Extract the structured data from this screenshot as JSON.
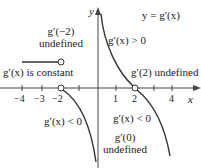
{
  "figure": {
    "curve_label": "y = g′(x)",
    "axis_x_label": "x",
    "axis_y_label": "y",
    "x_ticks": [
      "−4",
      "−3",
      "−2",
      "1",
      "2",
      "4"
    ],
    "annotations": {
      "g_neg2_line1": "g′(−2)",
      "g_neg2_line2": "undefined",
      "constant": "g′(x) is constant",
      "positive": "g′(x) > 0",
      "g2_undefined": "g′(2) undefined",
      "neg_left": "g′(x) < 0",
      "neg_right": "g′(x) < 0",
      "g0_line1": "g′(0)",
      "g0_line2": "undefined"
    },
    "colors": {
      "curve": "#333333",
      "axis": "#444444"
    }
  }
}
